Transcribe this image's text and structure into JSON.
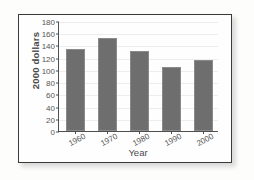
{
  "figure": {
    "frame_border_color": "#3a3a3a",
    "page_background": "#fdfdfc",
    "plot_background": "#fefefe"
  },
  "chart_data": {
    "type": "bar",
    "title": "",
    "subtitle": "",
    "xlabel": "Year",
    "ylabel": "2000 dollars",
    "categories": [
      "1960",
      "1970",
      "1980",
      "1990",
      "2000"
    ],
    "values": [
      134,
      152,
      131,
      104,
      116
    ],
    "ylim": [
      0,
      180
    ],
    "ytick_labels": [
      "0",
      "20",
      "40",
      "60",
      "80",
      "100",
      "120",
      "140",
      "160",
      "180"
    ],
    "ytick_values": [
      0,
      20,
      40,
      60,
      80,
      100,
      120,
      140,
      160,
      180
    ],
    "grid": true,
    "grid_orientation": "horizontal",
    "grid_color": "#ededed",
    "legend": null,
    "legend_position": "none",
    "bar_color": "#6e6e6e",
    "axis_color": "#4f4f4f",
    "annotations": []
  }
}
